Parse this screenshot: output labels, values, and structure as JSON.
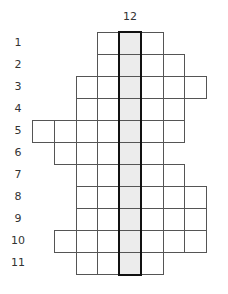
{
  "puzzle": {
    "type": "crossword-column",
    "key_column_clue": "12",
    "key_column_index": 4,
    "highlight_fill": "#ececec",
    "grid_origin": {
      "x": 32,
      "y": 32
    },
    "cell_size": {
      "w": 21.75,
      "h": 22
    },
    "rows": [
      {
        "label": "1",
        "start_col": 3,
        "end_col": 5
      },
      {
        "label": "2",
        "start_col": 3,
        "end_col": 6
      },
      {
        "label": "3",
        "start_col": 2,
        "end_col": 7
      },
      {
        "label": "4",
        "start_col": 2,
        "end_col": 6
      },
      {
        "label": "5",
        "start_col": 0,
        "end_col": 6
      },
      {
        "label": "6",
        "start_col": 1,
        "end_col": 5
      },
      {
        "label": "7",
        "start_col": 2,
        "end_col": 6
      },
      {
        "label": "8",
        "start_col": 2,
        "end_col": 7
      },
      {
        "label": "9",
        "start_col": 2,
        "end_col": 7
      },
      {
        "label": "10",
        "start_col": 1,
        "end_col": 7
      },
      {
        "label": "11",
        "start_col": 2,
        "end_col": 5
      }
    ]
  }
}
